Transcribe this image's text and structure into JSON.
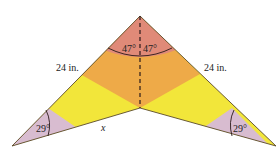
{
  "figure": {
    "type": "geometric-diagram",
    "labels": {
      "left_side": "24 in.",
      "right_side": "24 in.",
      "top_left_angle": "47°",
      "top_right_angle": "47°",
      "bottom_left_angle": "29°",
      "bottom_right_angle": "29°",
      "unknown_side": "x"
    },
    "colors": {
      "top_region": "#e08a78",
      "middle_band": "#eeaa48",
      "lower_band": "#f2e63a",
      "tip_regions": "#d8bcd0",
      "outline": "#5a4a2a",
      "dashed_line": "#2a1a1a"
    }
  }
}
